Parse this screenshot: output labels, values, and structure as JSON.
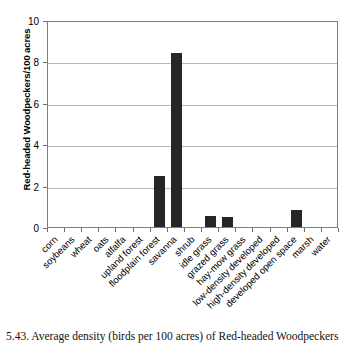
{
  "caption": "5.43.  Average density (birds per 100 acres) of Red-headed Woodpeckers",
  "chart_data": {
    "type": "bar",
    "title": "",
    "xlabel": "",
    "ylabel": "Red-headed Woodpeckers/100 acres",
    "ylim": [
      0,
      10
    ],
    "yticks": [
      0,
      2,
      4,
      6,
      8,
      10
    ],
    "grid": true,
    "legend": false,
    "bar_color": "#262626",
    "categories": [
      "corn",
      "soybeans",
      "wheat",
      "oats",
      "alfalfa",
      "upland forest",
      "floodplain forest",
      "savanna",
      "shrub",
      "idle grass",
      "grazed grass",
      "hay-mow grass",
      "low-density developed",
      "high-density developed",
      "developed open space",
      "marsh",
      "water"
    ],
    "values": [
      0,
      0,
      0,
      0,
      0,
      0,
      2.45,
      8.4,
      0,
      0.52,
      0.46,
      0,
      0,
      0,
      0.8,
      0,
      0
    ]
  }
}
